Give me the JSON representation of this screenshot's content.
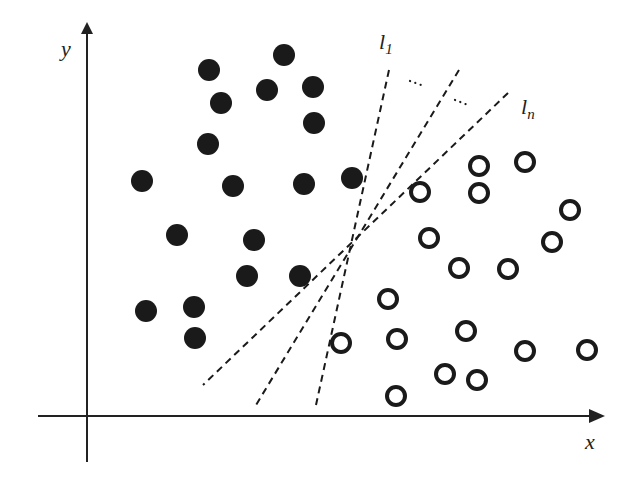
{
  "diagram": {
    "colors": {
      "ink": "#1a1a1a",
      "axis": "#222222",
      "background": "#ffffff"
    },
    "axes": {
      "x_label": "x",
      "y_label": "y",
      "origin": [
        87,
        416
      ],
      "x_axis": {
        "from": [
          38,
          416
        ],
        "to": [
          605,
          416
        ]
      },
      "y_axis": {
        "from": [
          87,
          462
        ],
        "to": [
          87,
          22
        ]
      }
    },
    "lines": [
      {
        "name": "l1",
        "label": "l",
        "subscript": "1",
        "from": [
          389,
          70
        ],
        "to": [
          316,
          405
        ],
        "label_pos": [
          379,
          49
        ]
      },
      {
        "name": "l-middle",
        "label": "",
        "subscript": "",
        "from": [
          459,
          70
        ],
        "to": [
          256,
          405
        ]
      },
      {
        "name": "ln",
        "label": "l",
        "subscript": "n",
        "from": [
          508,
          93
        ],
        "to": [
          203,
          385
        ],
        "label_pos": [
          521,
          114
        ]
      }
    ],
    "ellipsis_dots": [
      {
        "from": [
          410,
          81
        ],
        "to": [
          424,
          86
        ]
      },
      {
        "from": [
          455,
          100
        ],
        "to": [
          468,
          105
        ]
      }
    ],
    "class_filled": {
      "name": "filled-circles",
      "radius": 11,
      "points": [
        [
          209,
          70
        ],
        [
          284,
          55
        ],
        [
          267,
          90
        ],
        [
          313,
          87
        ],
        [
          221,
          103
        ],
        [
          314,
          123
        ],
        [
          208,
          144
        ],
        [
          142,
          181
        ],
        [
          233,
          186
        ],
        [
          304,
          184
        ],
        [
          352,
          178
        ],
        [
          177,
          235
        ],
        [
          254,
          240
        ],
        [
          247,
          276
        ],
        [
          300,
          276
        ],
        [
          146,
          311
        ],
        [
          194,
          307
        ],
        [
          195,
          338
        ]
      ]
    },
    "class_open": {
      "name": "open-circles",
      "radius": 9,
      "stroke_width": 4,
      "points": [
        [
          420,
          192
        ],
        [
          479,
          166
        ],
        [
          525,
          162
        ],
        [
          479,
          193
        ],
        [
          570,
          210
        ],
        [
          429,
          238
        ],
        [
          552,
          242
        ],
        [
          459,
          268
        ],
        [
          508,
          269
        ],
        [
          388,
          299
        ],
        [
          341,
          343
        ],
        [
          397,
          339
        ],
        [
          466,
          331
        ],
        [
          525,
          351
        ],
        [
          587,
          350
        ],
        [
          445,
          374
        ],
        [
          477,
          380
        ],
        [
          396,
          396
        ]
      ]
    }
  }
}
